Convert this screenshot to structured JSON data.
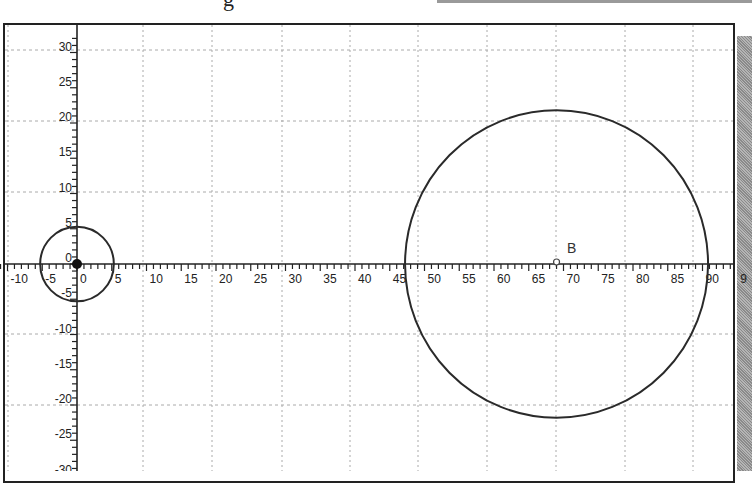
{
  "chart_data": {
    "type": "scatter",
    "title": "",
    "xlabel": "",
    "ylabel": "",
    "xlim": [
      -11,
      94
    ],
    "ylim": [
      -31,
      32
    ],
    "grid": true,
    "legend": null,
    "x_tick_labels": [
      "-10",
      "-5",
      "0",
      "5",
      "10",
      "15",
      "20",
      "25",
      "30",
      "35",
      "40",
      "45",
      "50",
      "55",
      "60",
      "65",
      "70",
      "75",
      "80",
      "85",
      "90",
      "9"
    ],
    "y_tick_labels": [
      "30",
      "25",
      "20",
      "15",
      "10",
      "5",
      "0",
      "-5",
      "-10",
      "-15",
      "-20",
      "-25",
      "-30"
    ],
    "shapes": [
      {
        "type": "circle",
        "name": "small-circle",
        "center": [
          0,
          0
        ],
        "radius": 5.3
      },
      {
        "type": "circle",
        "name": "large-circle",
        "center": [
          69,
          0
        ],
        "radius": 21.8
      }
    ],
    "points": [
      {
        "name": "origin",
        "x": 0,
        "y": 0,
        "style": "filled"
      },
      {
        "name": "B",
        "label": "B",
        "x": 69,
        "y": 0,
        "style": "open"
      }
    ]
  },
  "plot": {
    "point_b_label": "B",
    "colors": {
      "axis": "#222222",
      "grid": "#aaaaaa",
      "curve": "#2a2a2a",
      "shadow": "#9a9a9a"
    }
  }
}
